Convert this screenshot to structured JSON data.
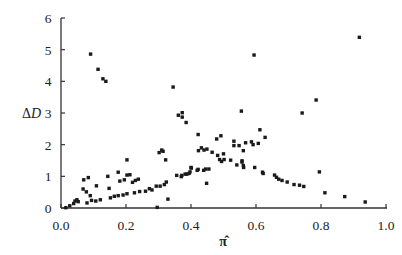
{
  "chart_data": {
    "type": "scatter",
    "title": "",
    "xlabel": "π̂",
    "ylabel": "ΔD",
    "xlim": [
      0.0,
      1.0
    ],
    "ylim": [
      0,
      6
    ],
    "x_ticks": [
      "0.0",
      "0.2",
      "0.4",
      "0.6",
      "0.8",
      "1.0"
    ],
    "y_ticks": [
      "0",
      "1",
      "2",
      "3",
      "4",
      "5",
      "6"
    ],
    "grid": false,
    "legend": null,
    "marker": "square",
    "marker_color": "#1a1a1a",
    "series": [
      {
        "name": "points",
        "points": [
          [
            0.015,
            0.01
          ],
          [
            0.027,
            0.07
          ],
          [
            0.039,
            0.14
          ],
          [
            0.043,
            0.22
          ],
          [
            0.049,
            0.26
          ],
          [
            0.053,
            0.2
          ],
          [
            0.07,
            0.89
          ],
          [
            0.084,
            0.96
          ],
          [
            0.068,
            0.6
          ],
          [
            0.078,
            0.51
          ],
          [
            0.09,
            0.39
          ],
          [
            0.08,
            0.16
          ],
          [
            0.094,
            0.24
          ],
          [
            0.109,
            0.7
          ],
          [
            0.107,
            0.22
          ],
          [
            0.121,
            0.26
          ],
          [
            0.144,
            1.0
          ],
          [
            0.148,
            0.62
          ],
          [
            0.176,
            1.13
          ],
          [
            0.181,
            0.85
          ],
          [
            0.195,
            0.89
          ],
          [
            0.203,
            1.04
          ],
          [
            0.152,
            0.32
          ],
          [
            0.164,
            0.37
          ],
          [
            0.176,
            0.39
          ],
          [
            0.191,
            0.41
          ],
          [
            0.203,
            0.45
          ],
          [
            0.203,
            1.52
          ],
          [
            0.212,
            1.05
          ],
          [
            0.22,
            0.81
          ],
          [
            0.229,
            0.87
          ],
          [
            0.238,
            0.91
          ],
          [
            0.226,
            0.48
          ],
          [
            0.242,
            0.52
          ],
          [
            0.26,
            0.53
          ],
          [
            0.272,
            0.61
          ],
          [
            0.28,
            0.57
          ],
          [
            0.293,
            0.69
          ],
          [
            0.305,
            0.69
          ],
          [
            0.318,
            0.74
          ],
          [
            0.324,
            0.82
          ],
          [
            0.329,
            0.28
          ],
          [
            0.296,
            0.02
          ],
          [
            0.356,
            1.03
          ],
          [
            0.37,
            0.99
          ],
          [
            0.382,
            1.07
          ],
          [
            0.394,
            1.09
          ],
          [
            0.4,
            1.28
          ],
          [
            0.419,
            1.19
          ],
          [
            0.361,
            2.93
          ],
          [
            0.373,
            3.01
          ],
          [
            0.373,
            2.87
          ],
          [
            0.385,
            2.7
          ],
          [
            0.322,
            1.52
          ],
          [
            0.314,
            1.79
          ],
          [
            0.302,
            1.75
          ],
          [
            0.422,
            2.32
          ],
          [
            0.479,
            2.18
          ],
          [
            0.492,
            2.28
          ],
          [
            0.532,
            2.11
          ],
          [
            0.532,
            1.97
          ],
          [
            0.548,
            1.97
          ],
          [
            0.31,
            1.83
          ],
          [
            0.345,
            3.82
          ],
          [
            0.091,
            4.86
          ],
          [
            0.114,
            4.38
          ],
          [
            0.129,
            4.08
          ],
          [
            0.138,
            4.0
          ],
          [
            0.423,
            1.81
          ],
          [
            0.432,
            1.9
          ],
          [
            0.44,
            1.83
          ],
          [
            0.449,
            1.86
          ],
          [
            0.465,
            1.76
          ],
          [
            0.482,
            1.66
          ],
          [
            0.488,
            1.53
          ],
          [
            0.494,
            1.47
          ],
          [
            0.5,
            1.71
          ],
          [
            0.502,
            1.53
          ],
          [
            0.522,
            1.51
          ],
          [
            0.541,
            1.36
          ],
          [
            0.557,
            1.49
          ],
          [
            0.561,
            1.34
          ],
          [
            0.439,
            1.19
          ],
          [
            0.445,
            1.23
          ],
          [
            0.455,
            1.23
          ],
          [
            0.422,
            1.22
          ],
          [
            0.401,
            1.26
          ],
          [
            0.397,
            1.14
          ],
          [
            0.387,
            1.07
          ],
          [
            0.372,
            1.03
          ],
          [
            0.448,
            0.78
          ],
          [
            0.568,
            2.06
          ],
          [
            0.586,
            2.09
          ],
          [
            0.555,
            3.06
          ],
          [
            0.594,
            4.83
          ],
          [
            0.612,
            2.47
          ],
          [
            0.628,
            2.23
          ],
          [
            0.607,
            2.04
          ],
          [
            0.591,
            2.0
          ],
          [
            0.561,
            1.81
          ],
          [
            0.557,
            1.45
          ],
          [
            0.562,
            1.28
          ],
          [
            0.596,
            1.28
          ],
          [
            0.622,
            1.09
          ],
          [
            0.62,
            1.13
          ],
          [
            0.657,
            1.04
          ],
          [
            0.663,
            0.97
          ],
          [
            0.67,
            0.91
          ],
          [
            0.68,
            0.87
          ],
          [
            0.696,
            0.82
          ],
          [
            0.717,
            0.74
          ],
          [
            0.734,
            0.72
          ],
          [
            0.747,
            0.68
          ],
          [
            0.742,
            3.0
          ],
          [
            0.785,
            3.41
          ],
          [
            0.795,
            1.14
          ],
          [
            0.812,
            0.48
          ],
          [
            0.873,
            0.36
          ],
          [
            0.936,
            0.19
          ],
          [
            0.918,
            5.39
          ]
        ]
      }
    ]
  },
  "axes": {
    "x_label": "π̂",
    "y_label_delta": "Δ",
    "y_label_var": "D"
  }
}
